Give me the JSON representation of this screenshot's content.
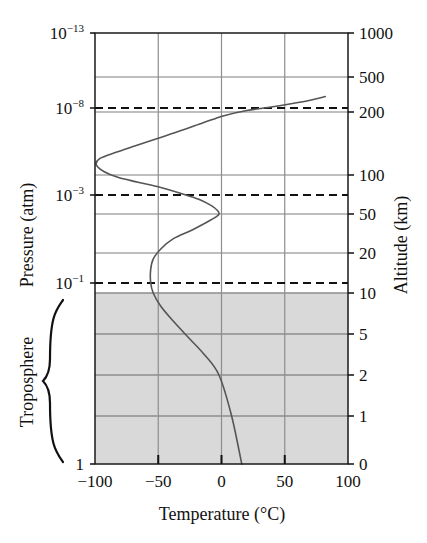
{
  "chart_data": {
    "type": "line",
    "title": "",
    "xlabel": "Temperature (°C)",
    "ylabel_left": "Pressure (atm)",
    "ylabel_right": "Altitude (km)",
    "xlim": [
      -100,
      100
    ],
    "xticks": [
      -100,
      -50,
      0,
      50,
      100
    ],
    "xticklabels": [
      "−100",
      "−50",
      "0",
      "50",
      "100"
    ],
    "grid": true,
    "legend": null,
    "left_axis": {
      "label": "Pressure (atm)",
      "scale": "log",
      "ticks": [
        {
          "label_base": "10",
          "label_exp": "−13",
          "value": 1e-13,
          "y": 33
        },
        {
          "label_base": "10",
          "label_exp": "−8",
          "value": 1e-08,
          "y": 108
        },
        {
          "label_base": "10",
          "label_exp": "−3",
          "value": 0.001,
          "y": 195
        },
        {
          "label_base": "10",
          "label_exp": "−1",
          "value": 0.1,
          "y": 283
        },
        {
          "label_base": "1",
          "label_exp": "",
          "value": 1,
          "y": 464
        }
      ]
    },
    "right_axis": {
      "label": "Altitude (km)",
      "ticks": [
        {
          "label": "1000",
          "value": 1000,
          "y": 33
        },
        {
          "label": "500",
          "value": 500,
          "y": 77
        },
        {
          "label": "200",
          "value": 200,
          "y": 112
        },
        {
          "label": "100",
          "value": 100,
          "y": 175
        },
        {
          "label": "50",
          "value": 50,
          "y": 214
        },
        {
          "label": "20",
          "value": 20,
          "y": 253
        },
        {
          "label": "10",
          "value": 10,
          "y": 293
        },
        {
          "label": "5",
          "value": 5,
          "y": 334
        },
        {
          "label": "2",
          "value": 2,
          "y": 375
        },
        {
          "label": "1",
          "value": 1,
          "y": 416
        },
        {
          "label": "0",
          "value": 0,
          "y": 464
        }
      ]
    },
    "dashed_boundaries": [
      {
        "name": "mesopause",
        "pressure": 1e-08,
        "altitude_km": 230,
        "y": 108
      },
      {
        "name": "stratopause",
        "pressure": 0.001,
        "altitude_km": 65,
        "y": 195
      },
      {
        "name": "tropopause",
        "pressure": 0.1,
        "altitude_km": 15,
        "y": 283
      }
    ],
    "shaded_region": {
      "label": "Troposphere",
      "from_altitude_km": 0,
      "to_altitude_km": 10,
      "color": "#d9d9d9"
    },
    "annotations": [
      {
        "text": "Troposphere",
        "type": "brace-label",
        "side": "left"
      }
    ],
    "series": [
      {
        "name": "Atmospheric temperature profile",
        "color": "#555555",
        "points_xy": [
          [
            16,
            0
          ],
          [
            8,
            1
          ],
          [
            -2,
            2
          ],
          [
            -14,
            3.2
          ],
          [
            -26,
            4.6
          ],
          [
            -38,
            6.2
          ],
          [
            -48,
            8.0
          ],
          [
            -54,
            10.0
          ],
          [
            -56,
            12
          ],
          [
            -56,
            15
          ],
          [
            -54,
            18
          ],
          [
            -48,
            22
          ],
          [
            -38,
            28
          ],
          [
            -24,
            34
          ],
          [
            -12,
            41
          ],
          [
            -4,
            47
          ],
          [
            -2,
            50
          ],
          [
            -3,
            53
          ],
          [
            -8,
            58
          ],
          [
            -18,
            65
          ],
          [
            -32,
            72
          ],
          [
            -48,
            80
          ],
          [
            -66,
            88
          ],
          [
            -82,
            96
          ],
          [
            -93,
            104
          ],
          [
            -99,
            112
          ],
          [
            -96,
            120
          ],
          [
            -84,
            128
          ],
          [
            -68,
            138
          ],
          [
            -50,
            150
          ],
          [
            -32,
            163
          ],
          [
            -14,
            178
          ],
          [
            2,
            192
          ],
          [
            20,
            208
          ],
          [
            38,
            226
          ],
          [
            55,
            248
          ],
          [
            70,
            272
          ],
          [
            82,
            300
          ]
        ]
      }
    ]
  },
  "plot_geometry": {
    "left": 95,
    "right": 348,
    "top": 33,
    "bottom": 464
  },
  "xaxis_title": "Temperature (°C)",
  "brace_label": "Troposphere"
}
